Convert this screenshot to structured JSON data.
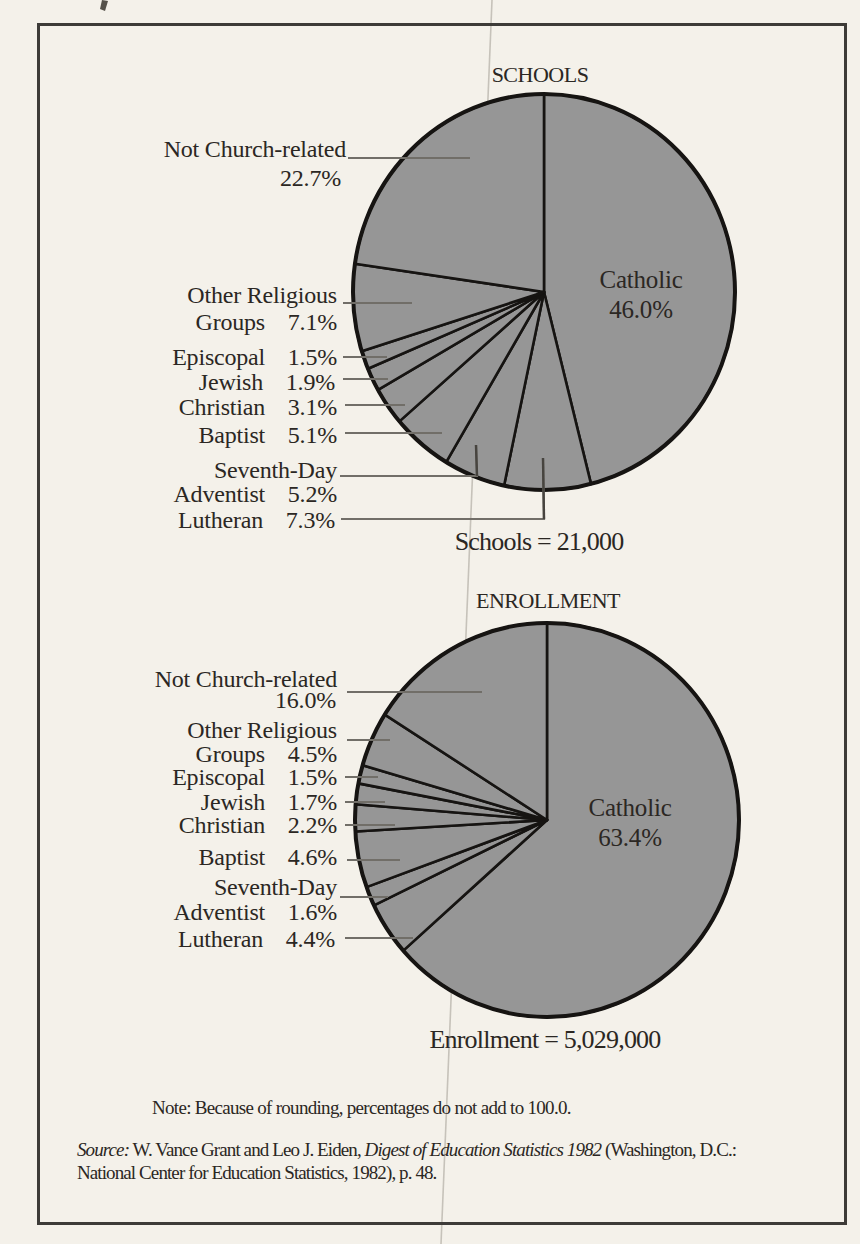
{
  "figure": {
    "note": "Note: Because of rounding, percentages do not add to 100.0.",
    "source": {
      "label": "Source:",
      "part1": " W. Vance Grant and Leo J. Eiden, ",
      "title_italic": "Digest of Education Statistics 1982",
      "part2": " (Washington, D.C.:",
      "line2": "National Center for Education Statistics, 1982), p. 48."
    }
  },
  "colors": {
    "paper": "#f4f1ea",
    "pie_fill": "#969696",
    "slice_line": "#161412",
    "leader": "#716e68",
    "leader_dark": "#47443f",
    "text": "#2b2723",
    "frame": "#3d3b38",
    "scan_line": "#b7b3aa"
  },
  "chart_data": [
    {
      "type": "pie",
      "title": "SCHOOLS",
      "total_label": "Schools = 21,000",
      "order": "clockwise from 12 o'clock",
      "slices": [
        {
          "name": "Catholic",
          "pct": 46.0,
          "label_position": "inside"
        },
        {
          "name": "Lutheran",
          "pct": 7.3,
          "label_lines": [
            "Lutheran"
          ]
        },
        {
          "name": "Seventh-Day Adventist",
          "pct": 5.2,
          "label_lines": [
            "Seventh-Day",
            "Adventist"
          ]
        },
        {
          "name": "Baptist",
          "pct": 5.1,
          "label_lines": [
            "Baptist"
          ]
        },
        {
          "name": "Christian",
          "pct": 3.1,
          "label_lines": [
            "Christian"
          ]
        },
        {
          "name": "Jewish",
          "pct": 1.9,
          "label_lines": [
            "Jewish"
          ]
        },
        {
          "name": "Episcopal",
          "pct": 1.5,
          "label_lines": [
            "Episcopal"
          ]
        },
        {
          "name": "Other Religious Groups",
          "pct": 7.1,
          "label_lines": [
            "Other Religious",
            "Groups"
          ]
        },
        {
          "name": "Not Church-related",
          "pct": 22.7,
          "label_lines": [
            "Not Church-related"
          ]
        }
      ]
    },
    {
      "type": "pie",
      "title": "ENROLLMENT",
      "total_label": "Enrollment = 5,029,000",
      "order": "clockwise from 12 o'clock",
      "slices": [
        {
          "name": "Catholic",
          "pct": 63.4,
          "label_position": "inside"
        },
        {
          "name": "Lutheran",
          "pct": 4.4,
          "label_lines": [
            "Lutheran"
          ]
        },
        {
          "name": "Seventh-Day Adventist",
          "pct": 1.6,
          "label_lines": [
            "Seventh-Day",
            "Adventist"
          ]
        },
        {
          "name": "Baptist",
          "pct": 4.6,
          "label_lines": [
            "Baptist"
          ]
        },
        {
          "name": "Christian",
          "pct": 2.2,
          "label_lines": [
            "Christian"
          ]
        },
        {
          "name": "Jewish",
          "pct": 1.7,
          "label_lines": [
            "Jewish"
          ]
        },
        {
          "name": "Episcopal",
          "pct": 1.5,
          "label_lines": [
            "Episcopal"
          ]
        },
        {
          "name": "Other Religious Groups",
          "pct": 4.5,
          "label_lines": [
            "Other Religious",
            "Groups"
          ]
        },
        {
          "name": "Not Church-related",
          "pct": 16.0,
          "label_lines": [
            "Not Church-related"
          ]
        }
      ]
    }
  ]
}
